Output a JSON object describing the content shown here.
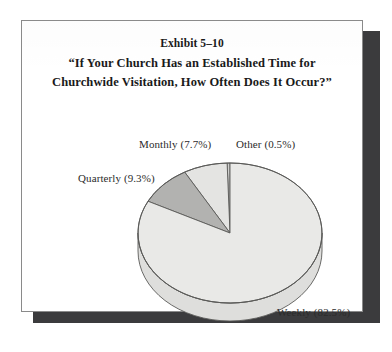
{
  "page": {
    "exhibit_number": "Exhibit 5–10",
    "question_line_1": "“If Your Church Has an Established Time for",
    "question_line_2": "Churchwide Visitation, How Often Does It Occur?”"
  },
  "labels": {
    "monthly": "Monthly (7.7%)",
    "other": "Other (0.5%)",
    "quarterly": "Quarterly (9.3%)",
    "weekly": "Weekly (82.5%)"
  },
  "colors": {
    "weekly_fill": "#e9e9e7",
    "monthly_fill": "#e4e4e2",
    "quarterly_fill": "#b2b2b0",
    "other_fill": "#cfcfcd",
    "side_wall": "#dededc",
    "outline": "#5a5a58",
    "page_shadow": "#3b3b3d",
    "text": "#1a1a1a"
  },
  "chart_data": {
    "type": "pie",
    "title": "“If Your Church Has an Established Time for Churchwide Visitation, How Often Does It Occur?”",
    "subtitle": "Exhibit 5–10",
    "xlabel": "",
    "ylabel": "",
    "legend_position": "outside-labels",
    "grid": false,
    "three_d": true,
    "start_angle_deg": 90,
    "direction": "counterclockwise",
    "units": "percent",
    "categories": [
      "Other",
      "Monthly",
      "Quarterly",
      "Weekly"
    ],
    "values": [
      0.5,
      7.7,
      9.3,
      82.5
    ],
    "slices": [
      {
        "name": "Other",
        "value": 0.5,
        "label": "Other (0.5%)",
        "color": "#cfcfcd"
      },
      {
        "name": "Monthly",
        "value": 7.7,
        "label": "Monthly (7.7%)",
        "color": "#e4e4e2"
      },
      {
        "name": "Quarterly",
        "value": 9.3,
        "label": "Quarterly (9.3%)",
        "color": "#b2b2b0"
      },
      {
        "name": "Weekly",
        "value": 82.5,
        "label": "Weekly (82.5%)",
        "color": "#e9e9e7"
      }
    ],
    "total": 100.0
  }
}
